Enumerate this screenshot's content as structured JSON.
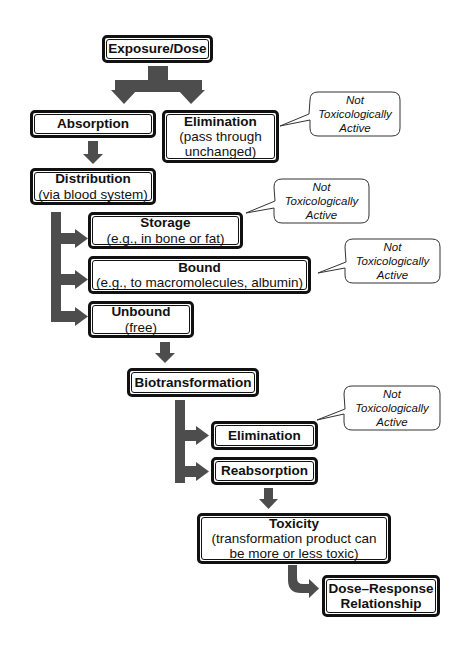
{
  "diagram": {
    "type": "flowchart",
    "colors": {
      "arrow": "#4d4d4d",
      "border": "#111111",
      "background": "#ffffff"
    },
    "nodes": {
      "exposure": {
        "title": "Exposure/Dose"
      },
      "absorption": {
        "title": "Absorption"
      },
      "elimination1": {
        "title": "Elimination",
        "sub1": "(pass through",
        "sub2": "unchanged)"
      },
      "distribution": {
        "title": "Distribution",
        "sub1": "(via blood system)"
      },
      "storage": {
        "title": "Storage",
        "sub1": "(e.g., in bone or fat)"
      },
      "bound": {
        "title": "Bound",
        "sub1": "(e.g., to macromolecules, albumin)"
      },
      "unbound": {
        "title": "Unbound",
        "sub1": "(free)"
      },
      "biotransformation": {
        "title": "Biotransformation"
      },
      "elimination2": {
        "title": "Elimination"
      },
      "reabsorption": {
        "title": "Reabsorption"
      },
      "toxicity": {
        "title": "Toxicity",
        "sub1": "(transformation product can",
        "sub2": "be more or less toxic)"
      },
      "dose_response": {
        "title": "Dose–Response",
        "sub1": "Relationship"
      }
    },
    "callouts": [
      {
        "line1": "Not",
        "line2": "Toxicologically",
        "line3": "Active",
        "target": "elimination1"
      },
      {
        "line1": "Not",
        "line2": "Toxicologically",
        "line3": "Active",
        "target": "storage"
      },
      {
        "line1": "Not",
        "line2": "Toxicologically",
        "line3": "Active",
        "target": "bound"
      },
      {
        "line1": "Not",
        "line2": "Toxicologically",
        "line3": "Active",
        "target": "elimination2"
      }
    ],
    "edges": [
      [
        "exposure",
        "absorption"
      ],
      [
        "exposure",
        "elimination1"
      ],
      [
        "absorption",
        "distribution"
      ],
      [
        "distribution",
        "storage"
      ],
      [
        "distribution",
        "bound"
      ],
      [
        "distribution",
        "unbound"
      ],
      [
        "unbound",
        "biotransformation"
      ],
      [
        "biotransformation",
        "elimination2"
      ],
      [
        "biotransformation",
        "reabsorption"
      ],
      [
        "reabsorption",
        "toxicity"
      ],
      [
        "toxicity",
        "dose_response"
      ]
    ]
  }
}
